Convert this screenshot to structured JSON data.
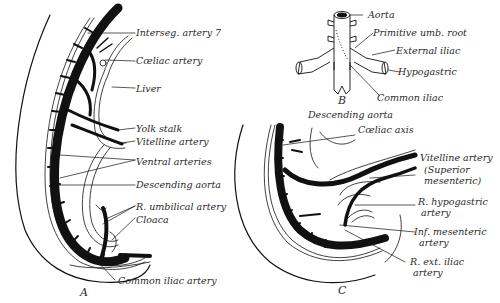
{
  "figures": {
    "A": {
      "letter": "A",
      "labels": {
        "interseg": "Interseg. artery 7",
        "coeliac": "Cœliac artery",
        "liver": "Liver",
        "yolk": "Yolk stalk",
        "vitelline": "Vitelline artery",
        "ventral": "Ventral arteries",
        "desc_aorta": "Descending aorta",
        "r_umb": "R. umbilical artery",
        "cloaca": "Cloaca",
        "common_iliac": "Common iliac artery"
      }
    },
    "B": {
      "letter": "B",
      "labels": {
        "aorta": "Aorta",
        "prim_umb": "Primitive umb. root",
        "ext_iliac": "External iliac",
        "hypogastric": "Hypogastric",
        "common_iliac": "Common iliac"
      }
    },
    "C": {
      "letter": "C",
      "labels": {
        "desc_aorta": "Descending aorta",
        "coeliac_axis": "Cœliac axis",
        "vitelline": "Vitelline artery",
        "superior": "(Superior",
        "mesenteric": "mesenteric)",
        "r_hypo": "R. hypogastric",
        "r_hypo2": "artery",
        "inf_mes": "Inf. mesenteric",
        "inf_mes2": "artery",
        "r_ext_iliac": "R. ext. iliac",
        "r_ext_iliac2": "artery"
      }
    }
  },
  "colors": {
    "ink": "#111111",
    "text": "#2a2a2a",
    "background": "#ffffff"
  }
}
